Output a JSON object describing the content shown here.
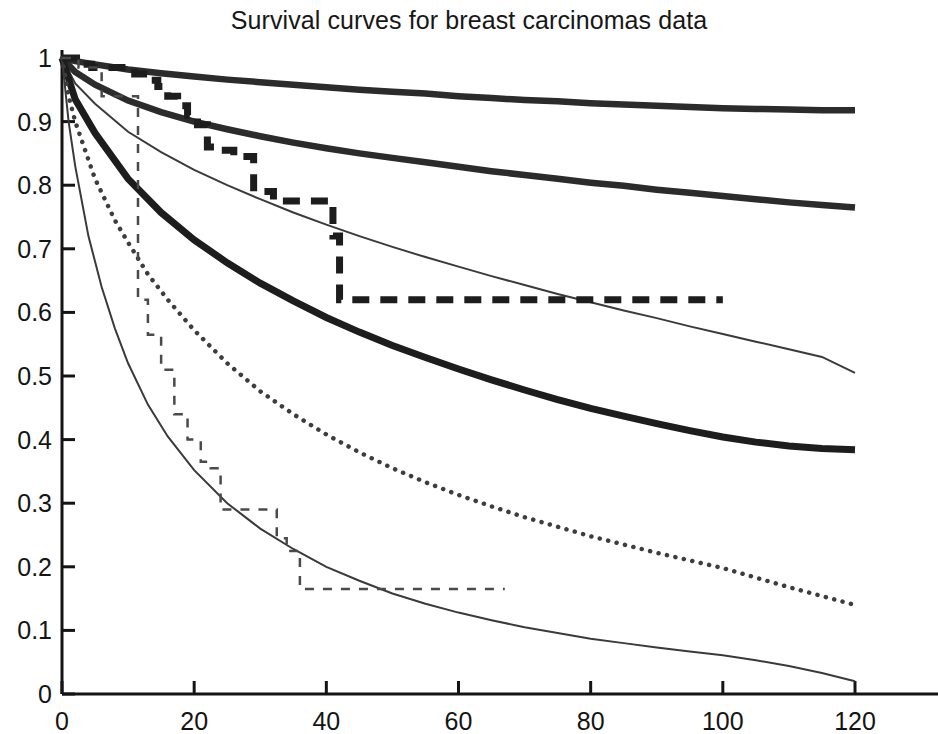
{
  "chart_data": {
    "type": "line",
    "title": "Survival curves for breast carcinomas data",
    "xlabel": "",
    "ylabel": "",
    "xlim": [
      0,
      120
    ],
    "ylim": [
      0,
      1
    ],
    "xticks": [
      0,
      20,
      40,
      60,
      80,
      100,
      120
    ],
    "xtick_labels": [
      "0",
      "20",
      "40",
      "60",
      "80",
      "100",
      "120"
    ],
    "yticks": [
      0,
      0.1,
      0.2,
      0.3,
      0.4,
      0.5,
      0.6,
      0.7,
      0.8,
      0.9,
      1
    ],
    "ytick_labels": [
      "0",
      "0.1",
      "0.2",
      "0.3",
      "0.4",
      "0.5",
      "0.6",
      "0.7",
      "0.8",
      "0.9",
      "1"
    ],
    "grid": false,
    "legend": "none",
    "axis_color": "#141414",
    "background": "#ffffff",
    "series": [
      {
        "name": "smooth-survival-group-1-thick",
        "style": "solid",
        "width": 6.5,
        "color": "#2b2b2b",
        "x": [
          0,
          2,
          5,
          10,
          15,
          20,
          25,
          30,
          35,
          40,
          45,
          50,
          55,
          60,
          65,
          70,
          75,
          80,
          85,
          90,
          95,
          100,
          105,
          110,
          115,
          120
        ],
        "y": [
          1.0,
          0.995,
          0.99,
          0.982,
          0.976,
          0.971,
          0.966,
          0.962,
          0.958,
          0.954,
          0.95,
          0.947,
          0.944,
          0.94,
          0.937,
          0.934,
          0.932,
          0.929,
          0.927,
          0.925,
          0.923,
          0.921,
          0.92,
          0.919,
          0.918,
          0.918
        ]
      },
      {
        "name": "smooth-survival-group-2-thick",
        "style": "solid",
        "width": 6.5,
        "color": "#2b2b2b",
        "x": [
          0,
          2,
          5,
          10,
          15,
          20,
          25,
          30,
          35,
          40,
          45,
          50,
          55,
          60,
          65,
          70,
          75,
          80,
          85,
          90,
          95,
          100,
          105,
          110,
          115,
          120
        ],
        "y": [
          1.0,
          0.978,
          0.958,
          0.933,
          0.915,
          0.9,
          0.888,
          0.877,
          0.867,
          0.858,
          0.85,
          0.843,
          0.836,
          0.829,
          0.822,
          0.816,
          0.81,
          0.804,
          0.799,
          0.793,
          0.788,
          0.783,
          0.778,
          0.773,
          0.769,
          0.765
        ]
      },
      {
        "name": "smooth-survival-group-3-thin",
        "style": "solid",
        "width": 2.0,
        "color": "#3a3a3a",
        "x": [
          0,
          2,
          5,
          10,
          15,
          20,
          25,
          30,
          35,
          40,
          45,
          50,
          55,
          60,
          65,
          70,
          75,
          80,
          85,
          90,
          95,
          100,
          105,
          110,
          115,
          120
        ],
        "y": [
          1.0,
          0.96,
          0.928,
          0.884,
          0.852,
          0.824,
          0.8,
          0.778,
          0.757,
          0.738,
          0.72,
          0.703,
          0.687,
          0.672,
          0.657,
          0.643,
          0.629,
          0.616,
          0.603,
          0.591,
          0.578,
          0.566,
          0.554,
          0.542,
          0.53,
          0.505
        ]
      },
      {
        "name": "smooth-survival-group-4-thick-steep",
        "style": "solid",
        "width": 7.0,
        "color": "#1d1d1d",
        "x": [
          0,
          2,
          5,
          10,
          15,
          20,
          25,
          30,
          35,
          40,
          45,
          50,
          55,
          60,
          65,
          70,
          75,
          80,
          85,
          90,
          95,
          100,
          105,
          110,
          115,
          120
        ],
        "y": [
          1.0,
          0.935,
          0.882,
          0.81,
          0.757,
          0.714,
          0.678,
          0.646,
          0.618,
          0.592,
          0.569,
          0.548,
          0.529,
          0.511,
          0.494,
          0.478,
          0.463,
          0.449,
          0.437,
          0.425,
          0.414,
          0.404,
          0.396,
          0.39,
          0.386,
          0.384
        ]
      },
      {
        "name": "smooth-survival-group-5-dotted",
        "style": "dotted",
        "width": 4.5,
        "color": "#3d3d3d",
        "x": [
          0,
          1,
          2,
          5,
          8,
          10,
          13,
          16,
          20,
          25,
          30,
          35,
          40,
          45,
          50,
          55,
          60,
          65,
          70,
          75,
          80,
          85,
          90,
          95,
          100,
          105,
          110,
          115,
          120
        ],
        "y": [
          1.0,
          0.94,
          0.9,
          0.81,
          0.745,
          0.71,
          0.66,
          0.62,
          0.572,
          0.52,
          0.476,
          0.44,
          0.408,
          0.38,
          0.355,
          0.333,
          0.313,
          0.295,
          0.278,
          0.263,
          0.248,
          0.235,
          0.222,
          0.21,
          0.198,
          0.183,
          0.168,
          0.154,
          0.14
        ]
      },
      {
        "name": "smooth-survival-group-6-thin-lowest",
        "style": "solid",
        "width": 2.0,
        "color": "#3a3a3a",
        "x": [
          0,
          1,
          2,
          4,
          6,
          8,
          10,
          13,
          16,
          20,
          25,
          30,
          35,
          40,
          45,
          50,
          55,
          60,
          65,
          70,
          75,
          80,
          85,
          90,
          95,
          100,
          105,
          110,
          115,
          120
        ],
        "y": [
          1.0,
          0.9,
          0.83,
          0.72,
          0.64,
          0.575,
          0.52,
          0.455,
          0.405,
          0.352,
          0.3,
          0.26,
          0.228,
          0.2,
          0.178,
          0.158,
          0.142,
          0.128,
          0.116,
          0.105,
          0.096,
          0.087,
          0.08,
          0.073,
          0.067,
          0.061,
          0.053,
          0.044,
          0.033,
          0.02
        ]
      },
      {
        "name": "kaplan-meier-step-thick-dashed",
        "style": "dashed",
        "width": 7.0,
        "color": "#1d1d1d",
        "step": true,
        "x": [
          0,
          1.5,
          2.2,
          3.5,
          4.5,
          6.5,
          8.5,
          11,
          13,
          14.5,
          16,
          17.5,
          19,
          20.5,
          22,
          24,
          26,
          29,
          32,
          34,
          36,
          38,
          41,
          42,
          100
        ],
        "y": [
          1.0,
          1.0,
          0.99,
          0.99,
          0.985,
          0.985,
          0.985,
          0.975,
          0.965,
          0.955,
          0.94,
          0.925,
          0.91,
          0.895,
          0.86,
          0.855,
          0.845,
          0.79,
          0.775,
          0.775,
          0.775,
          0.775,
          0.72,
          0.62,
          0.62
        ]
      },
      {
        "name": "kaplan-meier-step-thin-dashed",
        "style": "dashed",
        "width": 2.5,
        "color": "#4a4a4a",
        "step": true,
        "x": [
          0,
          1.5,
          2.5,
          4.5,
          6,
          8,
          10,
          11.5,
          13,
          15,
          17,
          19,
          21,
          22.5,
          24,
          27,
          30,
          32.5,
          34,
          36,
          67
        ],
        "y": [
          1.0,
          1.0,
          0.985,
          0.985,
          0.94,
          0.94,
          0.94,
          0.62,
          0.565,
          0.51,
          0.44,
          0.4,
          0.365,
          0.355,
          0.29,
          0.29,
          0.29,
          0.245,
          0.225,
          0.165,
          0.165
        ]
      }
    ]
  },
  "ghost_text": {
    "line_a": "Fig. 2   Other Breast Data set",
    "line_b": "Fig. 3   Other Breast Data set (DLBCL) Data set"
  }
}
